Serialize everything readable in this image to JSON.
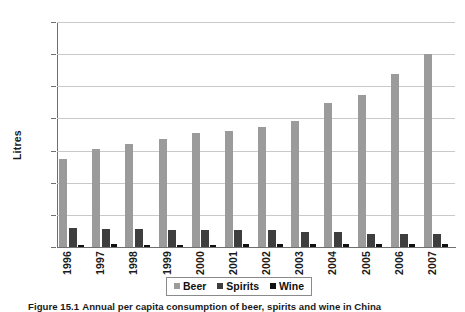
{
  "figure": {
    "caption_label": "Figure 15.1",
    "caption_text": "Annual per capita consumption of beer, spirits and wine in China"
  },
  "colors": {
    "beer": "#9b9b9b",
    "spirits": "#3e3e3e",
    "wine": "#101010",
    "grid": "#c9c9c9",
    "axis": "#6f6f6f"
  },
  "legend": {
    "position": "bottom-center",
    "items": [
      {
        "label": "Beer",
        "color": "#9b9b9b",
        "swatch": "beer-swatch"
      },
      {
        "label": "Spirits",
        "color": "#3e3e3e",
        "swatch": "spirits-swatch"
      },
      {
        "label": "Wine",
        "color": "#101010",
        "swatch": "wine-swatch"
      }
    ]
  },
  "chart_data": {
    "type": "bar",
    "title": "",
    "xlabel": "",
    "ylabel": "Litres",
    "ylim": [
      0,
      35
    ],
    "yticks": [
      0,
      5,
      10,
      15,
      20,
      25,
      30,
      35
    ],
    "ytick_labels": [
      "0",
      "5",
      "10",
      "15",
      "20",
      "25",
      "30",
      "35"
    ],
    "grid": true,
    "categories": [
      "1996",
      "1997",
      "1998",
      "1999",
      "2000",
      "2001",
      "2002",
      "2003",
      "2004",
      "2005",
      "2006",
      "2007"
    ],
    "series": [
      {
        "name": "Beer",
        "color": "#9b9b9b",
        "values": [
          13.7,
          15.3,
          16.0,
          16.8,
          17.7,
          18.0,
          18.7,
          19.6,
          22.4,
          23.7,
          26.9,
          30.0
        ]
      },
      {
        "name": "Spirits",
        "color": "#3e3e3e",
        "values": [
          2.9,
          2.8,
          2.8,
          2.6,
          2.6,
          2.7,
          2.6,
          2.4,
          2.3,
          2.1,
          2.1,
          2.0
        ]
      },
      {
        "name": "Wine",
        "color": "#101010",
        "values": [
          0.3,
          0.4,
          0.3,
          0.3,
          0.3,
          0.4,
          0.4,
          0.4,
          0.4,
          0.4,
          0.4,
          0.5
        ]
      }
    ]
  }
}
